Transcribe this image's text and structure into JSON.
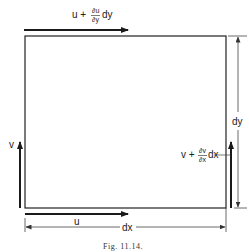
{
  "figure": {
    "caption": "Fig. 11.14.",
    "labels": {
      "top_base": "u +",
      "top_num": "∂u",
      "top_den": "∂y",
      "top_suffix": "dy",
      "right_base": "v +",
      "right_num": "∂v",
      "right_den": "∂x",
      "right_suffix": "dx",
      "left": "v",
      "bottom": "u",
      "width_dim": "dx",
      "height_dim": "dy"
    },
    "colors": {
      "ink": "#1a1a1a",
      "line": "#333333"
    }
  }
}
